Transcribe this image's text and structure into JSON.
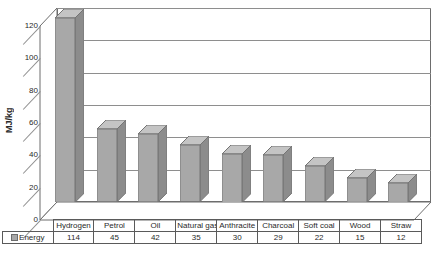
{
  "chart_data": {
    "type": "bar",
    "title": "",
    "xlabel": "",
    "ylabel": "MJ/kg",
    "ylim": [
      0,
      120
    ],
    "ytick_step": 20,
    "yticks": [
      120,
      100,
      80,
      60,
      40,
      20,
      0
    ],
    "grid": true,
    "legend_position": "bottom-left",
    "style": "3d-column",
    "categories": [
      "Hydrogen",
      "Petrol",
      "Oil",
      "Natural gas",
      "Anthracite",
      "Charcoal",
      "Soft coal",
      "Wood",
      "Straw"
    ],
    "series": [
      {
        "name": "Energy",
        "values": [
          114,
          45,
          42,
          35,
          30,
          29,
          22,
          15,
          12
        ],
        "color": "#a8a8a8"
      }
    ]
  },
  "table": {
    "legend_label": "Energy",
    "swatch_icon": "legend-swatch-icon"
  },
  "colors": {
    "bar_front": "#a8a8a8",
    "bar_side": "#8c8c8c",
    "bar_top": "#c4c4c4",
    "gridline": "#8e8e8e",
    "frame": "#6d6d6d",
    "table_border": "#5a5a5a",
    "background": "#ffffff"
  }
}
